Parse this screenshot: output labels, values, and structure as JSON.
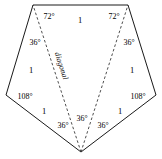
{
  "figure": {
    "kind": "regular-pentagon-with-diagonals",
    "canvas": {
      "width": 162,
      "height": 159
    },
    "stroke_color": "#1a1a1a",
    "dash_color": "#3a3a3a",
    "fill_color": "#ffffff"
  },
  "vertices": {
    "top_left": {
      "x": 33,
      "y": 5
    },
    "top_right": {
      "x": 128,
      "y": 5
    },
    "right": {
      "x": 156,
      "y": 95
    },
    "bottom": {
      "x": 81,
      "y": 152
    },
    "left": {
      "x": 6,
      "y": 95
    }
  },
  "diagonals": [
    {
      "name": "diagonal-left",
      "from": "bottom",
      "to": "top_left",
      "style": "dashed",
      "label": "diagonal"
    },
    {
      "name": "diagonal-right",
      "from": "bottom",
      "to": "top_right",
      "style": "dashed",
      "label": ""
    }
  ],
  "angle_labels": [
    {
      "name": "angle-top-left-72",
      "text": "72°",
      "x": 49,
      "y": 17
    },
    {
      "name": "angle-top-right-72",
      "text": "72°",
      "x": 114,
      "y": 17
    },
    {
      "name": "angle-top-left-36",
      "text": "36°",
      "x": 35,
      "y": 43
    },
    {
      "name": "angle-top-right-36",
      "text": "36°",
      "x": 129,
      "y": 43
    },
    {
      "name": "angle-left-108",
      "text": "108°",
      "x": 25,
      "y": 97
    },
    {
      "name": "angle-right-108",
      "text": "108°",
      "x": 138,
      "y": 97
    },
    {
      "name": "angle-bottom-left-36",
      "text": "36°",
      "x": 63,
      "y": 126
    },
    {
      "name": "angle-bottom-mid-36",
      "text": "36°",
      "x": 82,
      "y": 119
    },
    {
      "name": "angle-bottom-right-36",
      "text": "36°",
      "x": 103,
      "y": 126
    }
  ],
  "side_labels": [
    {
      "name": "side-top-1",
      "text": "1",
      "x": 80,
      "y": 20
    },
    {
      "name": "side-left-1",
      "text": "1",
      "x": 31,
      "y": 70
    },
    {
      "name": "side-right-1",
      "text": "1",
      "x": 132,
      "y": 70
    },
    {
      "name": "side-bottom-left-1",
      "text": "1",
      "x": 44,
      "y": 111
    },
    {
      "name": "side-bottom-right-1",
      "text": "1",
      "x": 120,
      "y": 111
    }
  ],
  "diagonal_label": {
    "name": "diagonal-label",
    "text": "diagonal",
    "x": 61,
    "y": 66,
    "rotation_deg": 72
  }
}
